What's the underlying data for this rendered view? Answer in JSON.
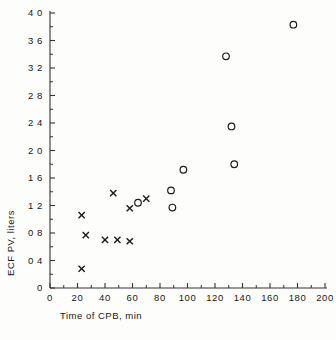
{
  "chart_data": {
    "type": "scatter",
    "title": "",
    "xlabel": "Time of CPB, min",
    "ylabel": "ECF PV, liters",
    "xlim": [
      0,
      200
    ],
    "ylim": [
      0,
      4.0
    ],
    "xticks": [
      "0",
      "20",
      "40",
      "60",
      "80",
      "100",
      "120",
      "140",
      "160",
      "180",
      "200"
    ],
    "xtick_values": [
      0,
      20,
      40,
      60,
      80,
      100,
      120,
      140,
      160,
      180,
      200
    ],
    "yticks": [
      "0",
      "0 4",
      "0 8",
      "1 2",
      "1 6",
      "2 0",
      "2 4",
      "2 8",
      "3 2",
      "3 6",
      "4 0"
    ],
    "ytick_values": [
      0,
      0.4,
      0.8,
      1.2,
      1.6,
      2.0,
      2.4,
      2.8,
      3.2,
      3.6,
      4.0
    ],
    "grid": false,
    "legend": false,
    "minor_ticks": true,
    "series": [
      {
        "name": "cross-series",
        "marker": "x",
        "points": [
          [
            23,
            0.28
          ],
          [
            23,
            1.06
          ],
          [
            26,
            0.77
          ],
          [
            40,
            0.7
          ],
          [
            46,
            1.38
          ],
          [
            49,
            0.7
          ],
          [
            58,
            0.68
          ],
          [
            58,
            1.16
          ],
          [
            70,
            1.3
          ]
        ]
      },
      {
        "name": "circle-series",
        "marker": "o",
        "points": [
          [
            64,
            1.24
          ],
          [
            88,
            1.42
          ],
          [
            89,
            1.17
          ],
          [
            97,
            1.72
          ],
          [
            128,
            3.37
          ],
          [
            132,
            2.35
          ],
          [
            134,
            1.8
          ],
          [
            177,
            3.83
          ]
        ]
      }
    ]
  }
}
